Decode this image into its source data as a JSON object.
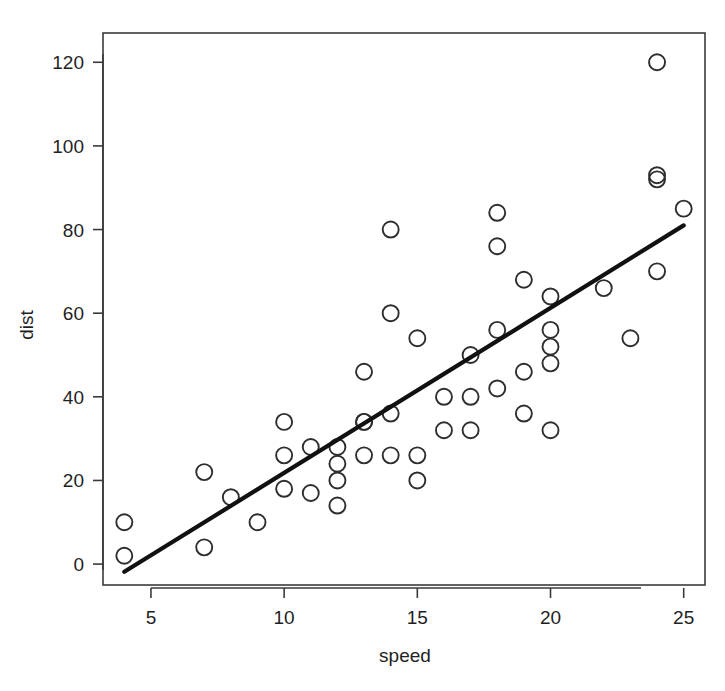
{
  "figure": {
    "background_color": "#ffffff",
    "point_color": "#2e2e2e",
    "line_color": "#111111",
    "axis_color": "#3b3b3b"
  },
  "chart_data": {
    "type": "scatter",
    "title": "",
    "xlabel": "speed",
    "ylabel": "dist",
    "xlim": [
      3.2,
      25.8
    ],
    "ylim": [
      -5,
      127
    ],
    "grid": false,
    "legend": null,
    "xticks": [
      5,
      10,
      15,
      20,
      25
    ],
    "xtick_labels": [
      "5",
      "10",
      "15",
      "20",
      "25"
    ],
    "yticks": [
      0,
      20,
      40,
      60,
      80,
      100,
      120
    ],
    "ytick_labels": [
      "0",
      "20",
      "40",
      "60",
      "80",
      "100",
      "120"
    ],
    "marker": "open-circle",
    "marker_size_px": 16,
    "n_points": 50,
    "x": [
      4,
      4,
      7,
      7,
      8,
      9,
      10,
      10,
      10,
      11,
      11,
      12,
      12,
      12,
      12,
      13,
      13,
      13,
      13,
      14,
      14,
      14,
      14,
      15,
      15,
      15,
      16,
      16,
      17,
      17,
      17,
      18,
      18,
      18,
      18,
      19,
      19,
      19,
      20,
      20,
      20,
      20,
      20,
      22,
      23,
      24,
      24,
      24,
      24,
      25
    ],
    "y": [
      2,
      10,
      4,
      22,
      16,
      10,
      18,
      26,
      34,
      17,
      28,
      14,
      20,
      24,
      28,
      26,
      34,
      34,
      46,
      26,
      36,
      60,
      80,
      20,
      26,
      54,
      32,
      40,
      32,
      40,
      50,
      42,
      56,
      76,
      84,
      36,
      46,
      68,
      32,
      48,
      52,
      56,
      64,
      66,
      54,
      70,
      92,
      93,
      120,
      85
    ],
    "overlay": {
      "type": "line",
      "name": "least-squares-fit",
      "x": [
        4,
        25
      ],
      "y": [
        -1.85,
        81.0
      ],
      "intercept": -17.58,
      "slope": 3.932
    }
  },
  "axes": {
    "x_title": "speed",
    "y_title": "dist"
  }
}
